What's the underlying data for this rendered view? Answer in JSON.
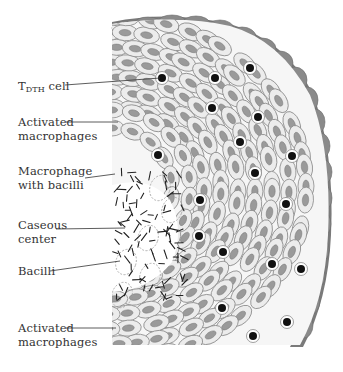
{
  "labels": [
    {
      "id": "tdth",
      "main": "T",
      "sub": "DTH",
      "suffix": " cell",
      "x": 18,
      "y": 79,
      "line": [
        [
          65,
          85
        ],
        [
          160,
          78
        ]
      ]
    },
    {
      "id": "activated-top",
      "line1": "Activated",
      "line2": "macrophages",
      "x": 18,
      "y": 115,
      "line": [
        [
          66,
          122
        ],
        [
          118,
          122
        ]
      ]
    },
    {
      "id": "macrophage-bacilli",
      "line1": "Macrophage",
      "line2": "with bacilli",
      "x": 18,
      "y": 164,
      "line": [
        [
          85,
          178
        ],
        [
          115,
          174
        ]
      ]
    },
    {
      "id": "caseous",
      "line1": "Caseous",
      "line2": "center",
      "x": 18,
      "y": 218,
      "line": [
        [
          56,
          229
        ],
        [
          125,
          228
        ]
      ]
    },
    {
      "id": "bacilli",
      "line1": "Bacilli",
      "x": 18,
      "y": 264,
      "line": [
        [
          50,
          271
        ],
        [
          120,
          261
        ]
      ]
    },
    {
      "id": "activated-bottom",
      "line1": "Activated",
      "line2": "macrophages",
      "x": 18,
      "y": 321,
      "line": [
        [
          66,
          328
        ],
        [
          116,
          328
        ]
      ]
    }
  ],
  "colors": {
    "outer_layer": "#7a7a7a",
    "outer_layer_light": "#8c8c8c",
    "cell_fill": "#ececec",
    "cell_stroke": "#8a8a8a",
    "nucleus": "#9a9a9a",
    "tcell": "#111111",
    "bacilli": "#222222",
    "text": "#333333"
  }
}
